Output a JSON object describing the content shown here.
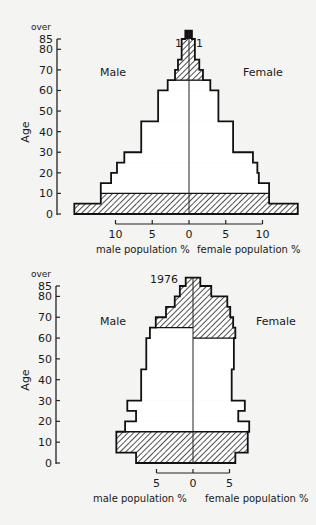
{
  "chart_data": [
    {
      "type": "bar",
      "subtype": "population-pyramid",
      "title": "1871",
      "ylabel": "Age",
      "y_ticks": [
        "0",
        "10",
        "20",
        "30",
        "40",
        "50",
        "60",
        "70",
        "80",
        "85"
      ],
      "y_top_label": "over",
      "x_ticks_male": [
        "10",
        "5",
        "0"
      ],
      "x_ticks_female": [
        "5",
        "10"
      ],
      "xlabel_male": "male population %",
      "xlabel_female": "female population %",
      "left_label": "Male",
      "right_label": "Female",
      "age_bands": [
        {
          "from": 0,
          "to": 5,
          "male": 15.6,
          "female": 14.8,
          "hatched": true
        },
        {
          "from": 5,
          "to": 10,
          "male": 12.0,
          "female": 10.9,
          "hatched": true
        },
        {
          "from": 10,
          "to": 15,
          "male": 12.0,
          "female": 10.9,
          "hatched": false
        },
        {
          "from": 15,
          "to": 20,
          "male": 10.6,
          "female": 9.5,
          "hatched": false
        },
        {
          "from": 20,
          "to": 25,
          "male": 9.8,
          "female": 9.3,
          "hatched": false
        },
        {
          "from": 25,
          "to": 30,
          "male": 8.8,
          "female": 8.7,
          "hatched": false
        },
        {
          "from": 30,
          "to": 45,
          "male": 6.5,
          "female": 6.0,
          "hatched": false
        },
        {
          "from": 45,
          "to": 60,
          "male": 4.2,
          "female": 4.0,
          "hatched": false
        },
        {
          "from": 60,
          "to": 65,
          "male": 2.9,
          "female": 2.9,
          "hatched": false
        },
        {
          "from": 65,
          "to": 70,
          "male": 1.9,
          "female": 1.9,
          "hatched": true
        },
        {
          "from": 70,
          "to": 75,
          "male": 1.5,
          "female": 1.4,
          "hatched": true
        },
        {
          "from": 75,
          "to": 85,
          "male": 1.0,
          "female": 0.8,
          "hatched": true
        },
        {
          "from": 85,
          "to": 89,
          "male": 0.5,
          "female": 0.4,
          "hatched": true,
          "solid": true
        }
      ],
      "x_max": 16,
      "ylim": [
        0,
        89
      ]
    },
    {
      "type": "bar",
      "subtype": "population-pyramid",
      "title": "1976",
      "ylabel": "Age",
      "y_ticks": [
        "0",
        "10",
        "20",
        "30",
        "40",
        "50",
        "60",
        "70",
        "80",
        "85"
      ],
      "y_top_label": "over",
      "x_ticks_male": [
        "5",
        "0"
      ],
      "x_ticks_female": [
        "5"
      ],
      "xlabel_male": "male population %",
      "xlabel_female": "female population %",
      "left_label": "Male",
      "right_label": "Female",
      "age_bands": [
        {
          "from": 0,
          "to": 5,
          "male": 7.8,
          "female": 5.8,
          "hatched": true
        },
        {
          "from": 5,
          "to": 10,
          "male": 10.5,
          "female": 7.5,
          "hatched": true
        },
        {
          "from": 10,
          "to": 15,
          "male": 10.5,
          "female": 7.5,
          "hatched": true
        },
        {
          "from": 15,
          "to": 20,
          "male": 9.3,
          "female": 7.7,
          "hatched": false
        },
        {
          "from": 20,
          "to": 25,
          "male": 7.8,
          "female": 6.2,
          "hatched": false
        },
        {
          "from": 25,
          "to": 30,
          "male": 9.0,
          "female": 7.1,
          "hatched": false
        },
        {
          "from": 30,
          "to": 45,
          "male": 7.1,
          "female": 5.3,
          "hatched": false
        },
        {
          "from": 45,
          "to": 60,
          "male": 6.4,
          "female": 5.6,
          "hatched": false
        },
        {
          "from": 60,
          "to": 65,
          "male": 5.9,
          "female": 5.8,
          "hatched": false,
          "female_hatched": true
        },
        {
          "from": 65,
          "to": 70,
          "male": 5.1,
          "female": 5.5,
          "hatched": true
        },
        {
          "from": 70,
          "to": 75,
          "male": 3.7,
          "female": 5.1,
          "hatched": true
        },
        {
          "from": 75,
          "to": 80,
          "male": 2.5,
          "female": 4.7,
          "hatched": true
        },
        {
          "from": 80,
          "to": 85,
          "male": 1.8,
          "female": 2.5,
          "hatched": true
        },
        {
          "from": 85,
          "to": 89,
          "male": 1.0,
          "female": 1.0,
          "hatched": true
        }
      ],
      "x_max": 11,
      "ylim": [
        0,
        89
      ]
    }
  ],
  "layout": {
    "charts": [
      {
        "axis_x": 57,
        "center_x": 189,
        "px_per_pct": 7.35,
        "y0": 214,
        "y85": 39,
        "tick_y": 224,
        "tick_label_y": 238,
        "xlabel_y": 253,
        "title_x": 175,
        "title_y": 47,
        "male_label_x": 100,
        "female_label_x": 258,
        "side_label_y": 76,
        "over_y": 30,
        "tick_left_pct": -10,
        "tick_right_pct": 10
      },
      {
        "axis_x": 56,
        "center_x": 193,
        "px_per_pct": 7.3,
        "y0": 463,
        "y85": 286,
        "tick_y": 473,
        "tick_label_y": 487,
        "xlabel_y": 502,
        "title_x": 178,
        "title_y": 283,
        "male_label_x": 100,
        "female_label_x": 268,
        "side_label_y": 325,
        "over_y": 277,
        "tick_left_pct": -5,
        "tick_right_pct": 5
      }
    ]
  }
}
